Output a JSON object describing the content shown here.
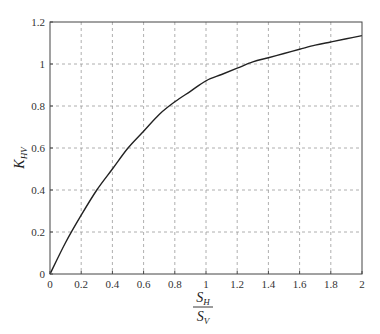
{
  "chart_data": {
    "type": "line",
    "title": "",
    "xlabel": "S_H / S_V",
    "xlabel_parts": {
      "numerator": "S",
      "numerator_sub": "H",
      "denominator": "S",
      "denominator_sub": "V"
    },
    "ylabel": "K_HV",
    "ylabel_parts": {
      "main": "K",
      "sub": "HV"
    },
    "xlim": [
      0,
      2
    ],
    "ylim": [
      0,
      1.2
    ],
    "xticks": [
      0,
      0.2,
      0.4,
      0.6,
      0.8,
      1,
      1.2,
      1.4,
      1.6,
      1.8,
      2
    ],
    "xtick_labels": [
      "0",
      "0.2",
      "0.4",
      "0.6",
      "0.8",
      "1",
      "1.2",
      "1.4",
      "1.6",
      "1.8",
      "2"
    ],
    "yticks": [
      0,
      0.2,
      0.4,
      0.6,
      0.8,
      1,
      1.2
    ],
    "ytick_labels": [
      "0",
      "0.2",
      "0.4",
      "0.6",
      "0.8",
      "1",
      "1.2"
    ],
    "grid": true,
    "grid_style": "dashed",
    "legend": null,
    "series": [
      {
        "name": "K_HV",
        "color": "#222222",
        "x": [
          0,
          0.1,
          0.2,
          0.3,
          0.4,
          0.5,
          0.6,
          0.7,
          0.8,
          0.9,
          1.0,
          1.1,
          1.2,
          1.3,
          1.4,
          1.5,
          1.6,
          1.7,
          1.8,
          1.9,
          2.0
        ],
        "y": [
          0,
          0.15,
          0.28,
          0.4,
          0.5,
          0.6,
          0.68,
          0.76,
          0.82,
          0.87,
          0.92,
          0.95,
          0.98,
          1.01,
          1.03,
          1.05,
          1.07,
          1.09,
          1.105,
          1.12,
          1.135
        ]
      }
    ]
  }
}
